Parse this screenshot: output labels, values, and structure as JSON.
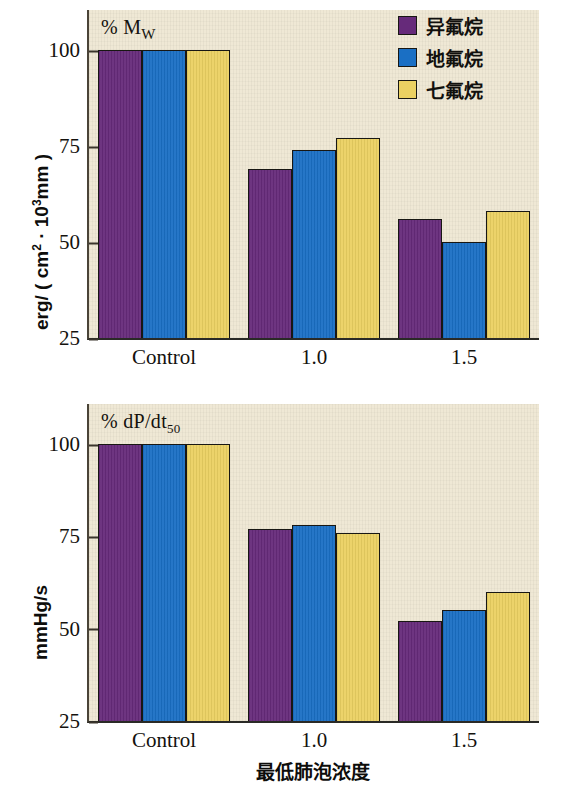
{
  "figure": {
    "background": "#ffffff",
    "panel_background": "#efe8d5"
  },
  "legend": {
    "position": "top-right",
    "items": [
      {
        "label": "异氟烷",
        "color": "#662a7a",
        "name": "isoflurane"
      },
      {
        "label": "地氟烷",
        "color": "#1a6fc4",
        "name": "desflurane"
      },
      {
        "label": "七氟烷",
        "color": "#ebd162",
        "name": "sevoflurane"
      }
    ]
  },
  "chart_data": [
    {
      "id": "top",
      "type": "bar",
      "title": "% M",
      "title_sub": "W",
      "ylabel": "erg/ ( cm2 · 103mm )",
      "xlabel": "",
      "categories": [
        "Control",
        "1.0",
        "1.5"
      ],
      "yticks": [
        100,
        75,
        50,
        25
      ],
      "ylim": [
        25,
        100
      ],
      "grid": false,
      "series": [
        {
          "name": "异氟烷",
          "color": "#662a7a",
          "values": [
            100,
            69,
            56
          ]
        },
        {
          "name": "地氟烷",
          "color": "#1a6fc4",
          "values": [
            100,
            74,
            50
          ]
        },
        {
          "name": "七氟烷",
          "color": "#ebd162",
          "values": [
            100,
            77,
            58
          ]
        }
      ]
    },
    {
      "id": "bottom",
      "type": "bar",
      "title": "% dP/dt",
      "title_sub": "50",
      "ylabel": "mmHg/s",
      "xlabel": "最低肺泡浓度",
      "categories": [
        "Control",
        "1.0",
        "1.5"
      ],
      "yticks": [
        100,
        75,
        50,
        25
      ],
      "ylim": [
        25,
        100
      ],
      "grid": false,
      "series": [
        {
          "name": "异氟烷",
          "color": "#662a7a",
          "values": [
            100,
            77,
            52
          ]
        },
        {
          "name": "地氟烷",
          "color": "#1a6fc4",
          "values": [
            100,
            78,
            55
          ]
        },
        {
          "name": "七氟烷",
          "color": "#ebd162",
          "values": [
            100,
            76,
            60
          ]
        }
      ]
    }
  ]
}
